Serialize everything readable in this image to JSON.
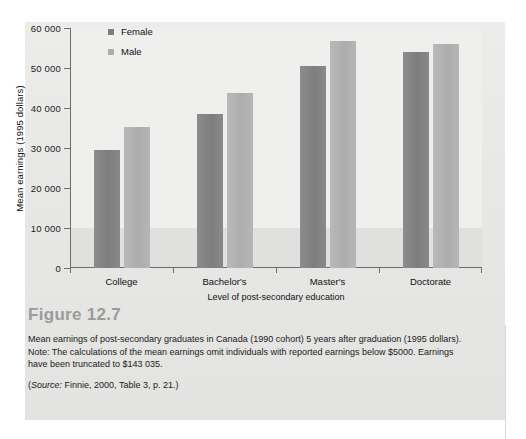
{
  "figure": {
    "number_label": "Figure 12.7",
    "caption": "Mean earnings of post-secondary graduates in Canada (1990 cohort) 5 years after graduation (1995 dollars). Note: The calculations of the mean earnings omit individuals with reported earnings below $5000. Earnings have been truncated to $143 035.",
    "source_prefix": "(",
    "source_italic": "Source:",
    "source_rest": " Finnie, 2000, Table 3, p. 21.)"
  },
  "chart_data": {
    "type": "bar",
    "title": "",
    "xlabel": "Level of post-secondary education",
    "ylabel": "Mean earnings (1995 dollars)",
    "categories": [
      "College",
      "Bachelor's",
      "Master's",
      "Doctorate"
    ],
    "series": [
      {
        "name": "Female",
        "color": "#7e7e7e",
        "values": [
          29500,
          38500,
          50500,
          54000
        ]
      },
      {
        "name": "Male",
        "color": "#adadad",
        "values": [
          35200,
          43800,
          56700,
          56100
        ]
      }
    ],
    "ylim": [
      0,
      60000
    ],
    "ytick_values": [
      0,
      10000,
      20000,
      30000,
      40000,
      50000,
      60000
    ],
    "ytick_labels": [
      "0",
      "10 000",
      "20 000",
      "30 000",
      "40 000",
      "50 000",
      "60 000"
    ],
    "grid": false,
    "legend_position": "top-left-inside"
  }
}
